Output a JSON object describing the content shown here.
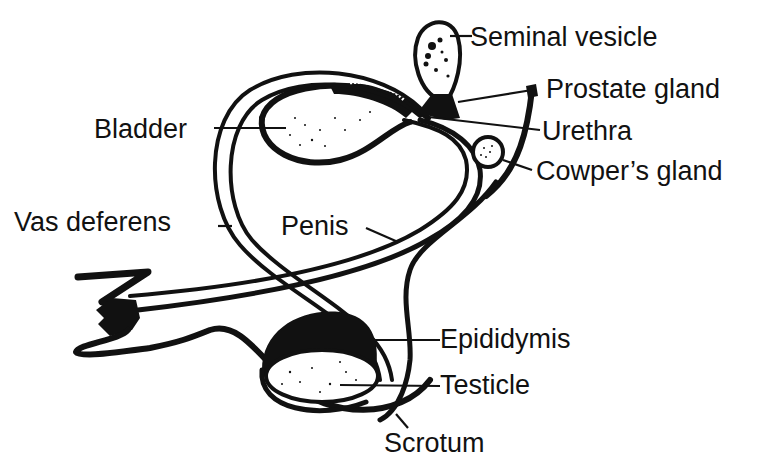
{
  "diagram": {
    "labels": {
      "seminal_vesicle": "Seminal vesicle",
      "prostate_gland": "Prostate gland",
      "bladder": "Bladder",
      "urethra": "Urethra",
      "cowpers_gland": "Cowper’s gland",
      "vas_deferens": "Vas deferens",
      "penis": "Penis",
      "epididymis": "Epididymis",
      "testicle": "Testicle",
      "scrotum": "Scrotum"
    },
    "colors": {
      "ink": "#111111",
      "background": "#ffffff"
    }
  }
}
